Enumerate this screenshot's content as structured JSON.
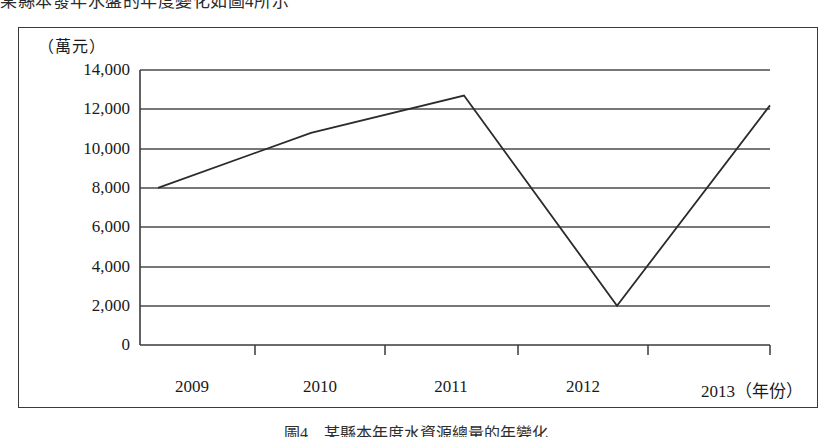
{
  "page": {
    "top_clipped_text": "某縣本發年水盤的年度變化如圖4所示",
    "bottom_caption": "圖4　某縣本年度水資源總量的年變化"
  },
  "figure": {
    "unit_label": "（萬元）",
    "x_axis_unit": "（年份）"
  },
  "chart_data": {
    "type": "line",
    "title": "",
    "subtitle": "",
    "xlabel": "（年份）",
    "ylabel": "（萬元）",
    "categories": [
      "2009",
      "2010",
      "2011",
      "2012",
      "2013"
    ],
    "values": [
      8000,
      10800,
      12700,
      2000,
      12200
    ],
    "series": [
      {
        "name": "",
        "values": [
          8000,
          10800,
          12700,
          2000,
          12200
        ]
      }
    ],
    "ylim": [
      0,
      14000
    ],
    "ytick_step": 2000,
    "yticks": [
      0,
      2000,
      4000,
      6000,
      8000,
      10000,
      12000,
      14000
    ],
    "ytick_labels": [
      "0",
      "2,000",
      "4,000",
      "6,000",
      "8,000",
      "10,000",
      "12,000",
      "14,000"
    ],
    "xtick_labels": [
      "2009",
      "2010",
      "2011",
      "2012",
      "2013"
    ],
    "grid": true,
    "grid_axis": "y",
    "legend": false,
    "legend_position": "none",
    "line_color": "#2b2b2b",
    "axis_color": "#3a3a3a",
    "grid_color": "#4a4a4a",
    "background": "#ffffff",
    "markers": false,
    "annotations": []
  }
}
